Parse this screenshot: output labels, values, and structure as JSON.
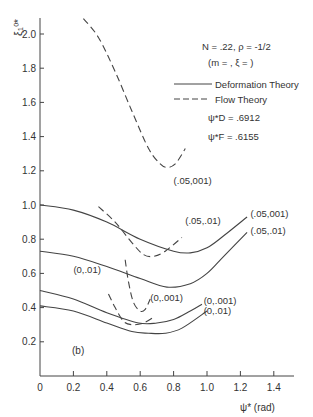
{
  "chart_data": {
    "type": "line",
    "panel_label": "(b)",
    "xlabel": "ψ* (rad)",
    "ylabel": "ξ₁⁰*",
    "xlim": [
      0,
      1.5
    ],
    "ylim": [
      0,
      2.1
    ],
    "xticks": [
      0,
      0.2,
      0.4,
      0.6,
      0.8,
      1.0,
      1.2,
      1.4
    ],
    "xtick_labels": [
      "0",
      "0.2",
      "0.4",
      "0.6",
      "0.8",
      "1.0",
      "1.2",
      "1.4"
    ],
    "yticks": [
      0.2,
      0.4,
      0.6,
      0.8,
      1.0,
      1.2,
      1.4,
      1.6,
      1.8,
      2.0
    ],
    "ytick_labels": [
      "0.2",
      "0.4",
      "0.6",
      "0.8",
      "1.0",
      "1.2",
      "1.4",
      "1.6",
      "1.8",
      "2.0"
    ],
    "grid": false,
    "annotations": {
      "params_line1": "N = .22, ρ = -1/2",
      "params_line2": "(m = , ξ =    )",
      "psi_D": "ψ*D = .6912",
      "psi_F": "ψ*F = .6155"
    },
    "legend": [
      {
        "label": "Deformation Theory",
        "style": "solid"
      },
      {
        "label": "Flow Theory",
        "style": "dashed"
      }
    ],
    "series": [
      {
        "name": "(.05,.001)",
        "theory": "Deformation",
        "style": "solid",
        "x": [
          0,
          0.2,
          0.4,
          0.6,
          0.8,
          0.9,
          1.0,
          1.1,
          1.24
        ],
        "y": [
          1.0,
          0.97,
          0.9,
          0.8,
          0.73,
          0.72,
          0.75,
          0.82,
          0.93
        ]
      },
      {
        "name": "(.05,.01)",
        "theory": "Deformation",
        "style": "solid",
        "x": [
          0,
          0.2,
          0.4,
          0.6,
          0.76,
          0.9,
          1.0,
          1.1,
          1.24
        ],
        "y": [
          0.73,
          0.7,
          0.64,
          0.57,
          0.52,
          0.54,
          0.6,
          0.7,
          0.84
        ]
      },
      {
        "name": "(0,.001)",
        "theory": "Deformation",
        "style": "solid",
        "x": [
          0,
          0.2,
          0.4,
          0.59,
          0.7,
          0.8,
          0.9,
          0.97
        ],
        "y": [
          0.5,
          0.45,
          0.37,
          0.31,
          0.31,
          0.33,
          0.38,
          0.42
        ]
      },
      {
        "name": "(0,.01)",
        "theory": "Deformation",
        "style": "solid",
        "x": [
          0,
          0.2,
          0.4,
          0.55,
          0.65,
          0.75,
          0.85,
          1.0
        ],
        "y": [
          0.41,
          0.38,
          0.31,
          0.26,
          0.25,
          0.25,
          0.28,
          0.38
        ]
      },
      {
        "name": "(.05,.001)",
        "theory": "Flow",
        "style": "dashed",
        "x": [
          0.26,
          0.35,
          0.45,
          0.55,
          0.65,
          0.72,
          0.76,
          0.81,
          0.87
        ],
        "y": [
          2.09,
          1.98,
          1.78,
          1.55,
          1.33,
          1.24,
          1.22,
          1.24,
          1.33
        ]
      },
      {
        "name": "(.05,.01)",
        "theory": "Flow",
        "style": "dashed",
        "x": [
          0.35,
          0.45,
          0.55,
          0.62,
          0.68,
          0.75,
          0.85
        ],
        "y": [
          0.99,
          0.9,
          0.78,
          0.71,
          0.7,
          0.73,
          0.81
        ]
      },
      {
        "name": "(0,.001)",
        "theory": "Flow",
        "style": "dashed",
        "x": [
          0.51,
          0.53,
          0.56,
          0.6,
          0.63,
          0.66
        ],
        "y": [
          0.68,
          0.55,
          0.43,
          0.38,
          0.39,
          0.45
        ]
      },
      {
        "name": "(0,.01)",
        "theory": "Flow",
        "style": "dashed",
        "x": [
          0.41,
          0.45,
          0.5,
          0.55,
          0.62,
          0.69
        ],
        "y": [
          0.48,
          0.4,
          0.32,
          0.3,
          0.31,
          0.35
        ]
      }
    ],
    "curve_labels": [
      {
        "text": "(.05,001)",
        "x": 0.8,
        "y": 1.12
      },
      {
        "text": "(.05,.01)",
        "x": 0.87,
        "y": 0.89
      },
      {
        "text": "(.05,001)",
        "x": 1.26,
        "y": 0.93
      },
      {
        "text": "(.05,.01)",
        "x": 1.26,
        "y": 0.83
      },
      {
        "text": "(0,.01)",
        "x": 0.2,
        "y": 0.6
      },
      {
        "text": "(0,.001)",
        "x": 0.66,
        "y": 0.44
      },
      {
        "text": "(0,.001)",
        "x": 0.98,
        "y": 0.42
      },
      {
        "text": "(0,.01)",
        "x": 0.98,
        "y": 0.36
      }
    ]
  }
}
